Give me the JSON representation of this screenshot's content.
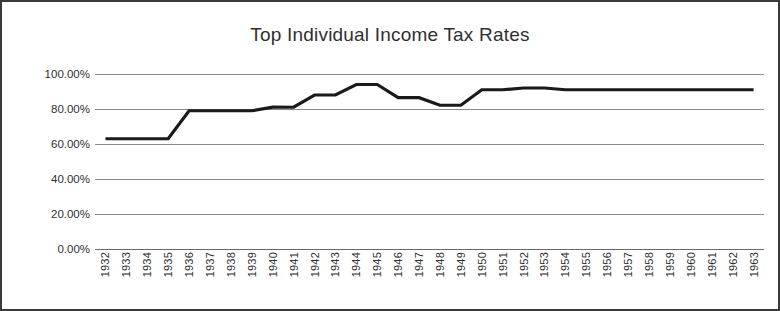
{
  "chart_data": {
    "type": "line",
    "title": "Top Individual Income Tax Rates",
    "xlabel": "",
    "ylabel": "",
    "ylim": [
      0,
      100
    ],
    "yticks": [
      0,
      20,
      40,
      60,
      80,
      100
    ],
    "ytick_labels": [
      "0.00%",
      "20.00%",
      "40.00%",
      "60.00%",
      "80.00%",
      "100.00%"
    ],
    "grid": true,
    "legend": "none",
    "line_color": "#1a1a1a",
    "gridline_color": "#8a8a8a",
    "border_color": "#3a3a3a",
    "categories": [
      "1932",
      "1933",
      "1934",
      "1935",
      "1936",
      "1937",
      "1938",
      "1939",
      "1940",
      "1941",
      "1942",
      "1943",
      "1944",
      "1945",
      "1946",
      "1947",
      "1948",
      "1949",
      "1950",
      "1951",
      "1952",
      "1953",
      "1954",
      "1955",
      "1956",
      "1957",
      "1958",
      "1959",
      "1960",
      "1961",
      "1962",
      "1963"
    ],
    "series": [
      {
        "name": "Top Individual Income Tax Rate",
        "values": [
          63,
          63,
          63,
          63,
          79,
          79,
          79,
          79,
          81.1,
          81,
          88,
          88,
          94,
          94,
          86.45,
          86.45,
          82.13,
          82.13,
          91,
          91,
          92,
          92,
          91,
          91,
          91,
          91,
          91,
          91,
          91,
          91,
          91,
          91
        ]
      }
    ]
  }
}
